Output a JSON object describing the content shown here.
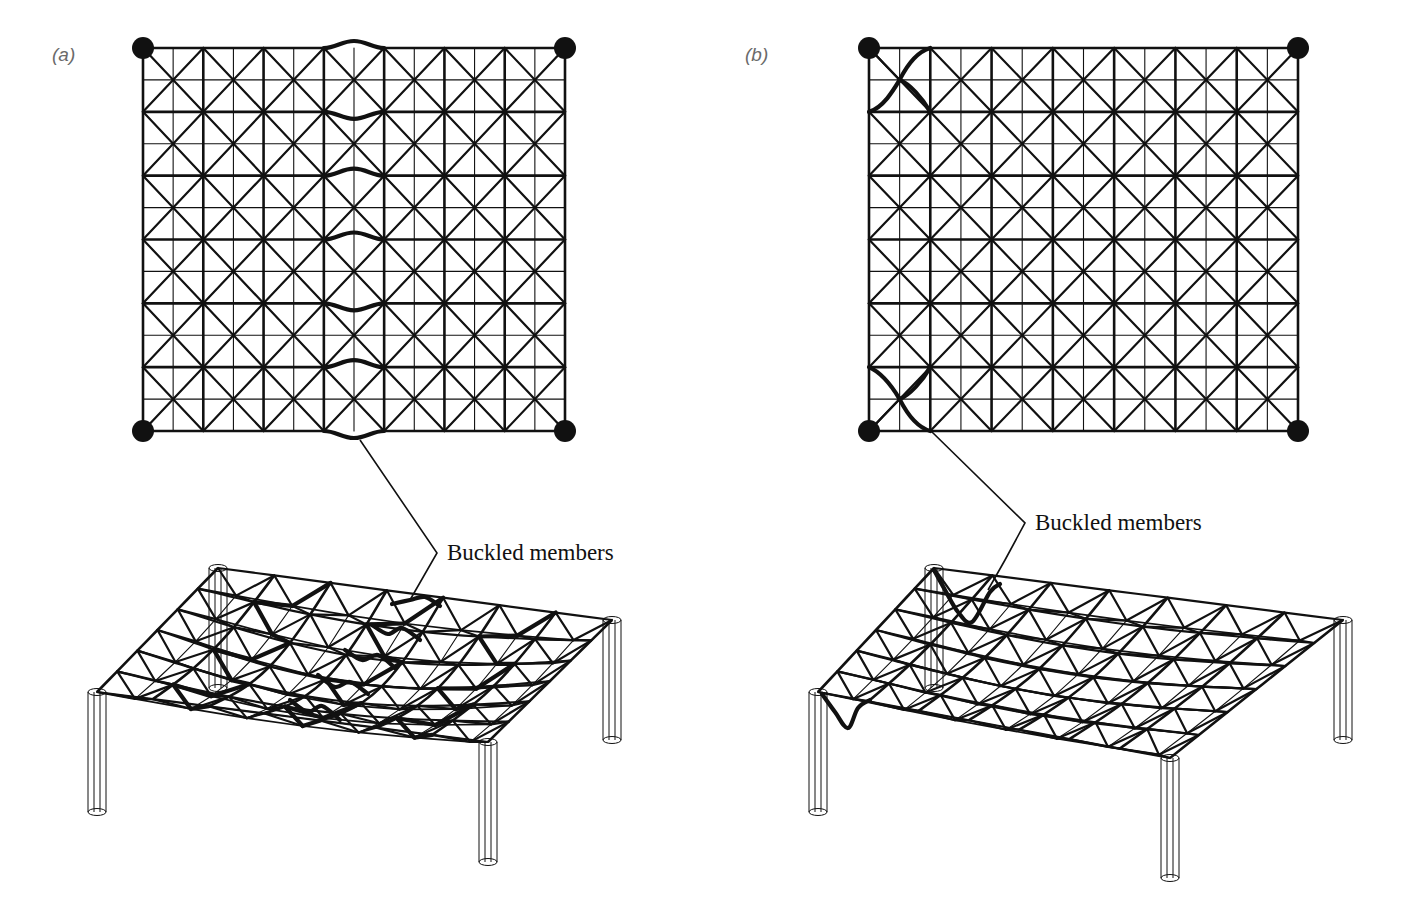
{
  "figure": {
    "panels": [
      {
        "id": "a",
        "label": "(a)",
        "label_pos": [
          52,
          44
        ],
        "callout": {
          "text": "Buckled members",
          "text_pos": [
            447,
            540
          ],
          "leader": [
            [
              360,
              440
            ],
            [
              437,
              553
            ],
            [
              410,
              600
            ]
          ]
        },
        "plan": {
          "origin": [
            143,
            48
          ],
          "size": [
            422,
            383
          ],
          "bays_x": 7,
          "bays_y": 6,
          "support_nodes": "corners",
          "buckled": {
            "type": "top_chords",
            "column_index": 3,
            "rows": [
              {
                "row": 0,
                "dir": -1
              },
              {
                "row": 1,
                "dir": 1
              },
              {
                "row": 2,
                "dir": -1
              },
              {
                "row": 3,
                "dir": -1
              },
              {
                "row": 4,
                "dir": 1
              },
              {
                "row": 5,
                "dir": -1
              },
              {
                "row": 6,
                "dir": 1
              }
            ]
          }
        },
        "iso": {
          "corners": {
            "back_left": [
              218,
              568
            ],
            "back_right": [
              612,
              620
            ],
            "front_right": [
              488,
              742
            ],
            "front_left": [
              97,
              692
            ]
          },
          "sag": 28,
          "bays_u": 7,
          "bays_v": 6,
          "column_height": 120,
          "buckled_lines": [
            [
              [
                392,
                604
              ],
              [
                410,
                600
              ],
              [
                425,
                597
              ],
              [
                440,
                606
              ]
            ],
            [
              [
                372,
                625
              ],
              [
                388,
                634
              ],
              [
                402,
                628
              ],
              [
                420,
                640
              ]
            ],
            [
              [
                345,
                650
              ],
              [
                362,
                660
              ],
              [
                378,
                655
              ],
              [
                395,
                668
              ]
            ],
            [
              [
                318,
                675
              ],
              [
                335,
                687
              ],
              [
                350,
                682
              ],
              [
                368,
                694
              ]
            ],
            [
              [
                290,
                700
              ],
              [
                308,
                712
              ],
              [
                322,
                706
              ],
              [
                340,
                720
              ]
            ]
          ],
          "heavy_diagonals": [
            1,
            3,
            5
          ]
        }
      },
      {
        "id": "b",
        "label": "(b)",
        "label_pos": [
          745,
          44
        ],
        "callout": {
          "text": "Buckled members",
          "text_pos": [
            1035,
            510
          ],
          "leader": [
            [
              931,
              431
            ],
            [
              1025,
              523
            ],
            [
              1005,
              560
            ],
            [
              988,
              590
            ]
          ]
        },
        "plan": {
          "origin": [
            869,
            48
          ],
          "size": [
            429,
            383
          ],
          "bays_x": 7,
          "bays_y": 6,
          "support_nodes": "corners",
          "buckled": {
            "type": "corner_diagonals",
            "bays": [
              {
                "bay": [
                  0,
                  0
                ],
                "from": "bottom_left",
                "to": "top_right"
              },
              {
                "bay": [
                  0,
                  5
                ],
                "from": "top_left",
                "to": "bottom_right"
              }
            ]
          }
        },
        "iso": {
          "corners": {
            "back_left": [
              934,
              568
            ],
            "back_right": [
              1343,
              620
            ],
            "front_right": [
              1170,
              758
            ],
            "front_left": [
              818,
              692
            ]
          },
          "sag": 14,
          "bays_u": 7,
          "bays_v": 6,
          "column_height": 120,
          "buckled_lines": [
            [
              [
                934,
                570
              ],
              [
                945,
                590
              ],
              [
                958,
                612
              ],
              [
                972,
                622
              ],
              [
                990,
                592
              ],
              [
                1000,
                584
              ]
            ],
            [
              [
                822,
                694
              ],
              [
                835,
                712
              ],
              [
                848,
                728
              ],
              [
                858,
                708
              ],
              [
                870,
                700
              ]
            ]
          ],
          "heavy_diagonals": []
        }
      }
    ]
  },
  "style": {
    "line_color": "#111111",
    "top_chord_width": 2.6,
    "bottom_chord_width": 1.1,
    "diagonal_width": 2.2,
    "buckle_width": 4.2,
    "node_radius": 11,
    "column_line_width": 1.0
  }
}
